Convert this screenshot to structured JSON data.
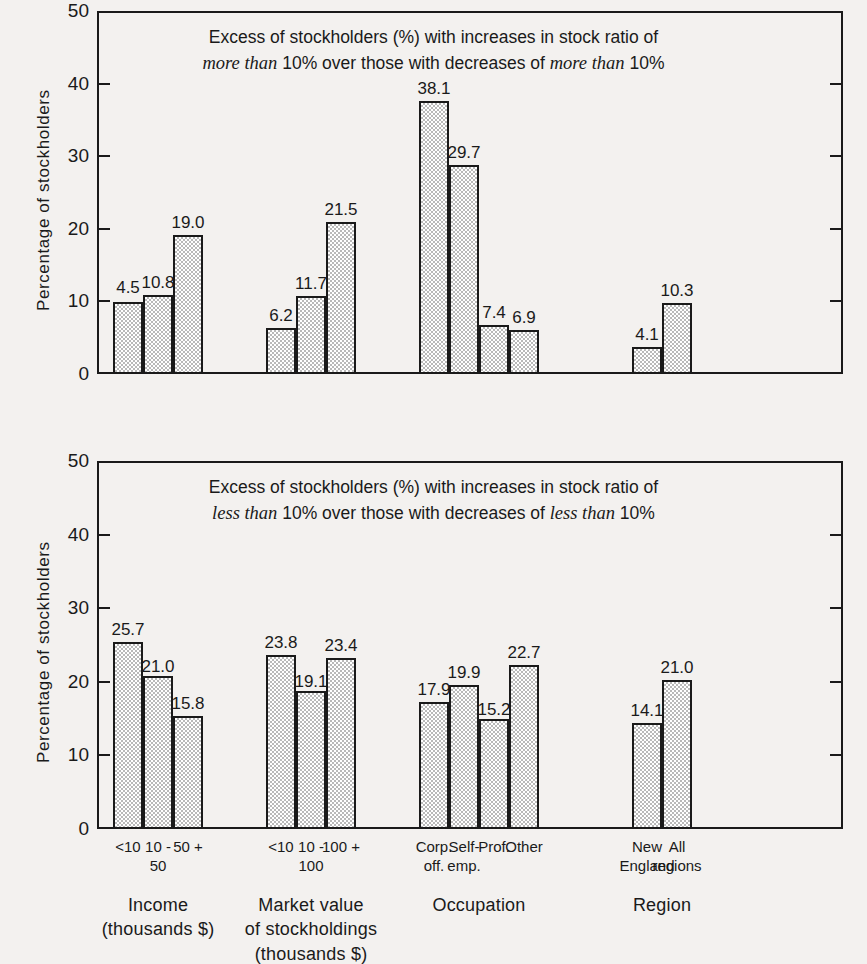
{
  "figure": {
    "background_color": "#f3f1ef",
    "ink_color": "#1a1a1a",
    "bar_fill_color": "#c9c9c9"
  },
  "chart_data": [
    {
      "type": "bar",
      "panel": "top",
      "title_line1": "Excess of stockholders (%) with increases in stock ratio of",
      "title_line2_pre": "",
      "title_line2_em1": "more than",
      "title_line2_mid": " 10% over those with decreases of ",
      "title_line2_em2": "more than",
      "title_line2_post": " 10%",
      "ylabel": "Percentage of stockholders",
      "xlabel": "",
      "ylim": [
        0,
        50
      ],
      "yticks": [
        0,
        10,
        20,
        30,
        40,
        50
      ],
      "grid": false,
      "legend": "none",
      "categories": [
        "<10",
        "10 -\n50",
        "50 +",
        "<10",
        "10 -\n100",
        "100 +",
        "Corp.\noff.",
        "Self-\nemp.",
        "Prof.",
        "Other",
        "New\nEngland",
        "All\nregions"
      ],
      "values": [
        4.5,
        10.8,
        19.0,
        6.2,
        11.7,
        21.5,
        38.1,
        29.7,
        7.4,
        6.9,
        4.1,
        10.3
      ],
      "drawn_heights": [
        9.9,
        10.9,
        19.1,
        6.3,
        10.8,
        21.0,
        37.6,
        28.8,
        6.8,
        6.0,
        3.7,
        9.8
      ]
    },
    {
      "type": "bar",
      "panel": "bottom",
      "title_line1": "Excess of stockholders (%) with increases in stock ratio of",
      "title_line2_pre": "",
      "title_line2_em1": "less than",
      "title_line2_mid": " 10% over those with decreases of ",
      "title_line2_em2": "less than",
      "title_line2_post": " 10%",
      "ylabel": "Percentage of stockholders",
      "xlabel": "",
      "ylim": [
        0,
        50
      ],
      "yticks": [
        0,
        10,
        20,
        30,
        40,
        50
      ],
      "grid": false,
      "legend": "none",
      "categories": [
        "<10",
        "10 -\n50",
        "50 +",
        "<10",
        "10 -\n100",
        "100 +",
        "Corp.\noff.",
        "Self-\nemp.",
        "Prof.",
        "Other",
        "New\nEngland",
        "All\nregions"
      ],
      "values": [
        25.7,
        21.0,
        15.8,
        23.8,
        19.1,
        23.4,
        17.9,
        19.9,
        15.2,
        22.7,
        14.1,
        21.0
      ],
      "drawn_heights": [
        25.4,
        20.8,
        15.4,
        23.6,
        18.7,
        23.2,
        17.2,
        19.6,
        15.0,
        22.3,
        14.4,
        20.3
      ]
    }
  ],
  "axis": {
    "ytick_labels": [
      "50",
      "40",
      "30",
      "20",
      "10",
      "0"
    ],
    "y_title": "Percentage of stockholders"
  },
  "xaxis": {
    "cat_labels": [
      "<10",
      "10 -\n50",
      "50 +",
      "<10",
      "10 -\n100",
      "100 +",
      "Corp.\noff.",
      "Self-\nemp.",
      "Prof.",
      "Other",
      "New\nEngland",
      "All\nregions"
    ],
    "groups": [
      {
        "label": "Income\n(thousands $)"
      },
      {
        "label": "Market value\nof stockholdings\n(thousands $)"
      },
      {
        "label": "Occupation"
      },
      {
        "label": "Region"
      }
    ]
  }
}
